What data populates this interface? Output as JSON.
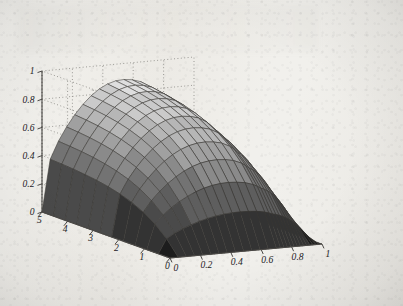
{
  "figure": {
    "kind": "3d-surface-plot",
    "style": "matlab-grayscale-mesh",
    "background_color": "#f1f0ec",
    "mesh_line_color": "#3a3936",
    "axis_line_color": "#4a4845",
    "grid_style": "dotted",
    "grid_color": "#8d8b86"
  },
  "chart_data": {
    "type": "surface",
    "title": "",
    "xlabel": "",
    "ylabel": "",
    "zlabel": "",
    "colormap": "gray",
    "grid": true,
    "legend": "none",
    "view": {
      "azimuth": -37.5,
      "elevation": 30
    },
    "axes": {
      "z": {
        "name": "z",
        "range": [
          0,
          1
        ],
        "ticks": [
          0,
          0.2,
          0.4,
          0.6,
          0.8,
          1
        ],
        "tick_labels": [
          "0",
          "0.2",
          "0.4",
          "0.6",
          "0.8",
          "1"
        ],
        "position": "left-vertical"
      },
      "y": {
        "name": "t",
        "range": [
          0,
          5
        ],
        "ticks": [
          0,
          1,
          2,
          3,
          4,
          5
        ],
        "tick_labels": [
          "5",
          "4",
          "3",
          "2",
          "1",
          "0"
        ],
        "position": "bottom-left",
        "note": "labels run 5 at far-left down to 0 at the front corner"
      },
      "x": {
        "name": "x",
        "range": [
          0,
          1
        ],
        "ticks": [
          0,
          0.2,
          0.4,
          0.6,
          0.8,
          1
        ],
        "tick_labels": [
          "0",
          "0.2",
          "0.4",
          "0.6",
          "0.8",
          "1"
        ],
        "position": "bottom-right"
      }
    },
    "z_tick_labels": [
      "1",
      "0.8",
      "0.6",
      "0.4",
      "0.2",
      "0"
    ],
    "y_tick_labels": [
      "5",
      "4",
      "3",
      "2",
      "1",
      "0"
    ],
    "x_tick_labels": [
      "0",
      "0.2",
      "0.4",
      "0.6",
      "0.8",
      "1"
    ],
    "zlim": [
      0,
      1
    ],
    "xlim": [
      0,
      1
    ],
    "ylim": [
      0,
      5
    ],
    "surface_colors": [
      "#1d1d1d",
      "#333333",
      "#4a4a4a",
      "#5e5e5e",
      "#737373",
      "#8a8a8a",
      "#a0a0a0",
      "#b6b6b6",
      "#cacaca",
      "#dedede",
      "#efefef"
    ]
  }
}
